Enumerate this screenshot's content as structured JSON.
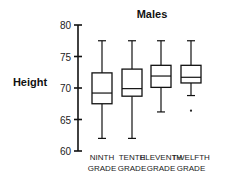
{
  "chart_data": {
    "type": "boxplot",
    "title": "Males",
    "xlabel": "",
    "ylabel": "Height",
    "ylim": [
      60,
      80
    ],
    "yticks": [
      60,
      65,
      70,
      75,
      80
    ],
    "grid": false,
    "legend": null,
    "categories": [
      [
        "NINTH",
        "GRADE"
      ],
      [
        "TENTH",
        "GRADE"
      ],
      [
        "ELEVENTH",
        "GRADE"
      ],
      [
        "TWELFTH",
        "GRADE"
      ]
    ],
    "series": [
      {
        "name": "NINTH GRADE",
        "whisker_low": 62.0,
        "q1": 67.5,
        "median": 69.2,
        "q3": 72.4,
        "whisker_high": 77.5,
        "outliers": []
      },
      {
        "name": "TENTH GRADE",
        "whisker_low": 62.0,
        "q1": 68.7,
        "median": 69.9,
        "q3": 73.0,
        "whisker_high": 77.5,
        "outliers": []
      },
      {
        "name": "ELEVENTH GRADE",
        "whisker_low": 66.2,
        "q1": 70.1,
        "median": 71.9,
        "q3": 73.6,
        "whisker_high": 77.5,
        "outliers": []
      },
      {
        "name": "TWELFTH GRADE",
        "whisker_low": 68.8,
        "q1": 70.8,
        "median": 71.7,
        "q3": 73.6,
        "whisker_high": 77.5,
        "outliers": [
          66.4
        ]
      }
    ]
  },
  "layout": {
    "axis_x": 78,
    "y_top_px": 25,
    "y_bottom_px": 151,
    "box_centers": [
      102,
      132,
      161,
      191
    ],
    "box_half_width": 10,
    "cap_half_width": 4
  }
}
